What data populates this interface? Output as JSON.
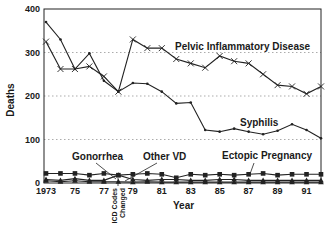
{
  "chart_data": {
    "type": "line",
    "title": "",
    "xlabel": "Year",
    "ylabel": "Deaths",
    "ylim": [
      0,
      400
    ],
    "xlim": [
      1973,
      1992
    ],
    "grid": "horizontal dotted at 100, 200, 300",
    "y_ticks": [
      "0",
      "100",
      "200",
      "300",
      "400"
    ],
    "x_ticks": [
      "1973",
      "75",
      "77",
      "79",
      "81",
      "83",
      "85",
      "87",
      "89",
      "91"
    ],
    "x": [
      1973,
      1974,
      1975,
      1976,
      1977,
      1978,
      1979,
      1980,
      1981,
      1982,
      1983,
      1984,
      1985,
      1986,
      1987,
      1988,
      1989,
      1990,
      1991,
      1992
    ],
    "series": [
      {
        "name": "Pelvic Inflammatory Disease",
        "marker": "x",
        "values": [
          325,
          262,
          262,
          268,
          245,
          210,
          330,
          310,
          310,
          285,
          275,
          265,
          292,
          280,
          275,
          250,
          225,
          222,
          205,
          222
        ]
      },
      {
        "name": "Syphilis",
        "marker": "dot",
        "values": [
          370,
          330,
          262,
          298,
          235,
          210,
          230,
          228,
          210,
          183,
          185,
          122,
          118,
          125,
          118,
          112,
          120,
          135,
          122,
          103
        ]
      },
      {
        "name": "Ectopic Pregnancy",
        "marker": "square",
        "values": [
          22,
          22,
          22,
          18,
          22,
          18,
          20,
          22,
          20,
          12,
          20,
          18,
          20,
          18,
          20,
          22,
          18,
          20,
          20,
          20
        ]
      },
      {
        "name": "Gonorrhea",
        "marker": "triangle",
        "values": [
          5,
          3,
          5,
          3,
          3,
          3,
          2,
          3,
          2,
          2,
          2,
          2,
          2,
          2,
          2,
          2,
          2,
          2,
          2,
          2
        ]
      },
      {
        "name": "Other VD",
        "marker": "triangle",
        "values": [
          8,
          6,
          10,
          6,
          6,
          18,
          8,
          6,
          8,
          8,
          6,
          6,
          8,
          8,
          6,
          6,
          6,
          6,
          6,
          6
        ]
      }
    ],
    "annotations": [
      {
        "text": "ICD Codes Changed",
        "x": 1978,
        "orientation": "vertical"
      }
    ],
    "legend_position": "inline labels"
  },
  "labels": {
    "ylabel": "Deaths",
    "xlabel": "Year",
    "pid": "Pelvic Inflammatory Disease",
    "syphilis": "Syphilis",
    "gonorrhea": "Gonorrhea",
    "other_vd": "Other VD",
    "ectopic": "Ectopic Pregnancy",
    "icd_line1": "ICD Codes",
    "icd_line2": "Changed"
  }
}
